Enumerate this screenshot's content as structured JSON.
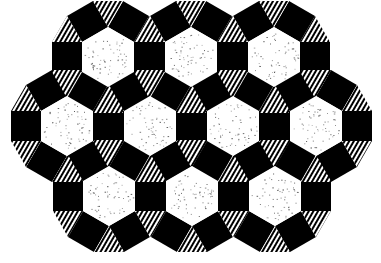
{
  "tiling": {
    "type": "3.4.6.4",
    "edge_length": 30,
    "hex_centers": [
      {
        "x": 108,
        "y": 57
      },
      {
        "x": 191,
        "y": 57
      },
      {
        "x": 274,
        "y": 57
      },
      {
        "x": 67,
        "y": 126
      },
      {
        "x": 150,
        "y": 126
      },
      {
        "x": 233,
        "y": 126
      },
      {
        "x": 316,
        "y": 126
      },
      {
        "x": 109,
        "y": 196
      },
      {
        "x": 192,
        "y": 196
      },
      {
        "x": 275,
        "y": 196
      }
    ],
    "tiles": {
      "hexagon": {
        "label": "speckled white hexagon",
        "fill": "#ffffff",
        "speckle": "#555555"
      },
      "square": {
        "label": "black square",
        "fill": "#000000"
      },
      "triangle": {
        "label": "hatched triangle",
        "fill": "#ffffff",
        "hatch": "#000000"
      }
    }
  },
  "background": "#ffffff"
}
